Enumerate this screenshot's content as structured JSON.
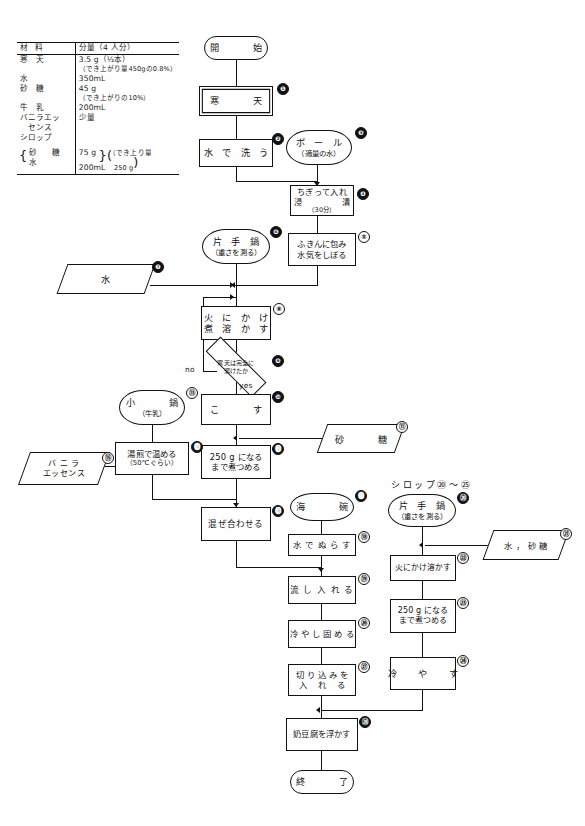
{
  "document": {
    "title": "寒天・奶豆腐 調理工程フローチャート",
    "language": "ja"
  },
  "ingredients_table": {
    "name": "材料表",
    "columns": [
      "材　　料",
      "分量（4 人分）"
    ],
    "rows": [
      {
        "item": "寒　天",
        "amount": "3.5 g（½本）",
        "note": "（でき上がり量450gの0.8%）"
      },
      {
        "item": "水",
        "amount": "350mL",
        "note": ""
      },
      {
        "item": "砂　糖",
        "amount": "45 g",
        "note": "（でき上がりの10%）"
      },
      {
        "item": "牛　乳",
        "amount": "200mL",
        "note": ""
      },
      {
        "item": "バニラエッ\nセンス",
        "amount": "少量",
        "note": ""
      },
      {
        "item": "シロップ",
        "amount": "",
        "note": ""
      },
      {
        "item": "（砂　糖",
        "amount": "75 g",
        "note": "（でき上り量"
      },
      {
        "item": "　水",
        "amount": "200mL",
        "note": "　250 g"
      }
    ],
    "header_item": "材",
    "header_item2": "料",
    "header_amount": "分量（4 人分）",
    "r1_item": "寒　天",
    "r1_a": "3.5 g（½本）",
    "r1_b": "（でき上がり量450gの0.8%）",
    "r2_item": "水",
    "r2_a": "350mL",
    "r3_item": "砂　糖",
    "r3_a": "45 g",
    "r3_b": "（でき上がりの10%）",
    "r4_item": "牛　乳",
    "r4_a": "200mL",
    "r5_item": "バニラエッ",
    "r5_item2": "　センス",
    "r5_a": "少量",
    "r6_item": "シロップ",
    "r7_item": "砂　糖",
    "r7_a": "75 g",
    "r7_b": "（でき上り量",
    "r8_item": "水",
    "r8_a": "200mL",
    "r8_b": "250 g"
  },
  "flowchart": {
    "start": {
      "label": "開　　始",
      "shape": "terminator"
    },
    "end": {
      "label": "終　　了",
      "shape": "terminator"
    },
    "free_labels": {
      "syrup_section": "シロップ⑳〜㉕",
      "decision_no": "no",
      "decision_yes": "yes"
    },
    "nodes": [
      {
        "id": "n1",
        "num": "❶",
        "num_style": "fill",
        "label": "寒　　天",
        "shape": "double-box"
      },
      {
        "id": "n2",
        "num": "❷",
        "num_style": "fill",
        "label": "水 で 洗 う",
        "shape": "box"
      },
      {
        "id": "n3",
        "num": "❸",
        "num_style": "fill",
        "label": "ボ ー ル",
        "sub": "（適量の水）",
        "shape": "manual"
      },
      {
        "id": "n4",
        "num": "❹",
        "num_style": "fill",
        "label": "ちぎって入れ",
        "line2": "浸　　　漬",
        "sub": "（30分）",
        "shape": "box"
      },
      {
        "id": "n5",
        "num": "⑤",
        "num_style": "open",
        "label": "ふきんに包み",
        "line2": "水気をしぼる",
        "shape": "box"
      },
      {
        "id": "n6",
        "num": "❻",
        "num_style": "fill",
        "label": "片 手 鍋",
        "sub": "（重さを測る）",
        "shape": "manual"
      },
      {
        "id": "n7",
        "num": "❼",
        "num_style": "fill",
        "label": "水",
        "shape": "parallelogram"
      },
      {
        "id": "n8",
        "num": "⑧",
        "num_style": "open",
        "label": "火 に か け",
        "line2": "煮 溶 か す",
        "shape": "box"
      },
      {
        "id": "n9",
        "num": "❾",
        "num_style": "fill",
        "label": "寒天は完全に",
        "line2": "溶けたか",
        "shape": "diamond"
      },
      {
        "id": "n10",
        "num": "❿",
        "num_style": "fill",
        "label": "こ　　す",
        "shape": "box"
      },
      {
        "id": "n11",
        "num": "⑪",
        "num_style": "open",
        "label": "砂　　糖",
        "shape": "parallelogram"
      },
      {
        "id": "n12",
        "num": "⓬",
        "num_style": "fill",
        "label": "250 g になる",
        "line2": "まで煮つめる",
        "shape": "box"
      },
      {
        "id": "n13",
        "num": "⑬",
        "num_style": "open",
        "label": "小　　鍋",
        "sub": "（牛乳）",
        "shape": "manual"
      },
      {
        "id": "n14",
        "num": "⓮",
        "num_style": "fill",
        "label": "湯煎で温める",
        "sub": "（50℃ぐらい）",
        "shape": "box"
      },
      {
        "id": "n15",
        "num": "⑮",
        "num_style": "open",
        "label": "バ ニ ラ",
        "line2": "エッセンス",
        "shape": "parallelogram"
      },
      {
        "id": "n16",
        "num": "⓰",
        "num_style": "fill",
        "label": "混ぜ合わせる",
        "shape": "box"
      },
      {
        "id": "n17",
        "num": "⓱",
        "num_style": "fill",
        "label": "海　　碗",
        "shape": "manual"
      },
      {
        "id": "n18",
        "num": "⑱",
        "num_style": "open",
        "label": "水 で ぬ ら す",
        "shape": "box"
      },
      {
        "id": "n19",
        "num": "⑲",
        "num_style": "open",
        "label": "流 し 入 れ る",
        "shape": "box"
      },
      {
        "id": "n20",
        "num": "㉖",
        "num_style": "open",
        "label": "冷 や し 固 め る",
        "shape": "box"
      },
      {
        "id": "n21",
        "num": "㉗",
        "num_style": "open",
        "label": "切 り 込 み を",
        "line2": "入　 れ 　る",
        "shape": "box"
      },
      {
        "id": "n22",
        "num": "㉘",
        "num_style": "fill",
        "label": "奶豆腐を浮かす",
        "shape": "box"
      },
      {
        "id": "s20",
        "num": "⑳",
        "num_style": "fill",
        "label": "片 手 鍋",
        "sub": "（重さを測る）",
        "shape": "manual"
      },
      {
        "id": "s21",
        "num": "㉑",
        "num_style": "open",
        "label": "水 ， 砂 糖",
        "shape": "parallelogram"
      },
      {
        "id": "s22",
        "num": "㉒",
        "num_style": "open",
        "label": "火にかけ溶かす",
        "shape": "box"
      },
      {
        "id": "s23",
        "num": "㉓",
        "num_style": "open",
        "label": "250 g になる",
        "line2": "まで煮つめる",
        "shape": "box"
      },
      {
        "id": "s24",
        "num": "㉔",
        "num_style": "open",
        "label": "冷 　や 　す",
        "shape": "box"
      }
    ]
  }
}
